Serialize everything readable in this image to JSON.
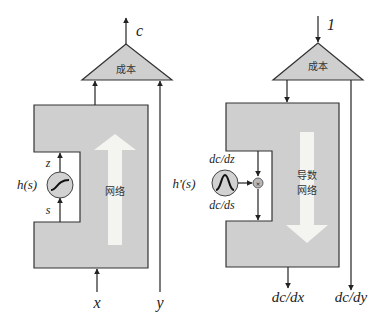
{
  "colors": {
    "block_fill": "#cfcfcf",
    "block_stroke": "#333333",
    "arrow_fill": "#f4f4f0",
    "circle_fill": "#d2d2d2",
    "line": "#222222"
  },
  "left_panel": {
    "output_label": "c",
    "cost_label": "成本",
    "network_label": "网络",
    "function_label": "h(s)",
    "z_label": "z",
    "s_label": "s",
    "input_x_label": "x",
    "input_y_label": "y"
  },
  "right_panel": {
    "input_label": "1",
    "cost_label": "成本",
    "network_label_line1": "导数",
    "network_label_line2": "网络",
    "function_label": "h'(s)",
    "dz_label": "dc/dz",
    "ds_label": "dc/ds",
    "output_dx_label": "dc/dx",
    "output_dy_label": "dc/dy"
  }
}
